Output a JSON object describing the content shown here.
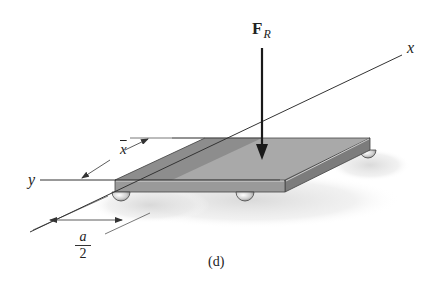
{
  "figure": {
    "caption": "(d)"
  },
  "labels": {
    "force_symbol": "F",
    "force_subscript": "R",
    "x_axis": "x",
    "y_axis": "y",
    "xbar": "x",
    "half_a_numerator": "a",
    "half_a_denominator": "2"
  },
  "colors": {
    "plate_top_light": "#a8a8a8",
    "plate_top_dark": "#8e8e8e",
    "plate_front": "#9a9a9a",
    "plate_side": "#7c7c7c",
    "edge_highlight": "#d8d8d8",
    "line": "#333333",
    "arrow": "#1a1a1a",
    "shadow": "#e6e6e6"
  }
}
